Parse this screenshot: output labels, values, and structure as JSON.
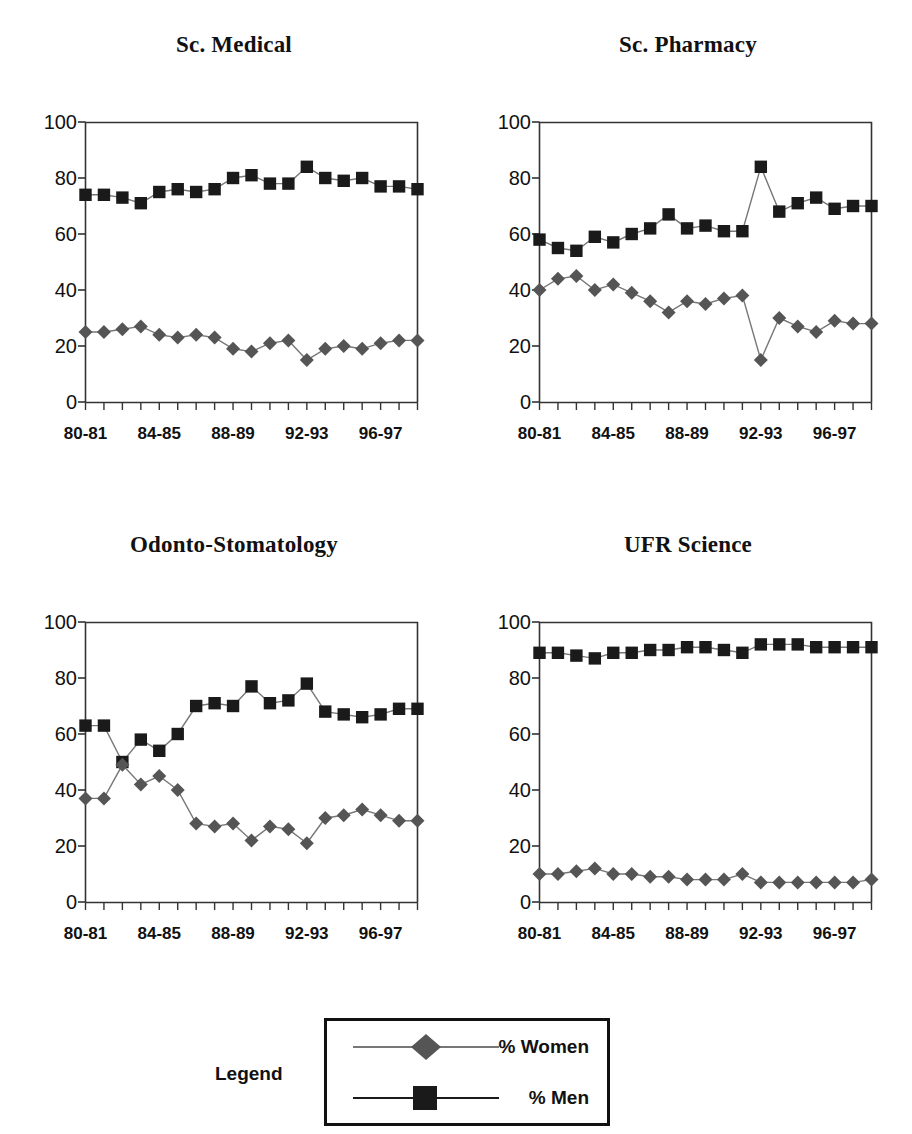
{
  "figure": {
    "legend_label": "Legend",
    "series_names": {
      "women": "% Women",
      "men": "% Men"
    },
    "colors": {
      "women_marker": "#555555",
      "men_marker": "#1a1a1a",
      "line": "#777777",
      "axis": "#333333"
    }
  },
  "chart_data": [
    {
      "type": "line",
      "title": "Sc. Medical",
      "xlabel": "",
      "ylabel": "",
      "ylim": [
        0,
        100
      ],
      "yticks": [
        0,
        20,
        40,
        60,
        80,
        100
      ],
      "grid": false,
      "legend_position": "bottom-shared",
      "categories": [
        "80-81",
        "81-82",
        "82-83",
        "83-84",
        "84-85",
        "85-86",
        "86-87",
        "87-88",
        "88-89",
        "89-90",
        "90-91",
        "91-92",
        "92-93",
        "93-94",
        "94-95",
        "95-96",
        "96-97",
        "97-98",
        "98-99"
      ],
      "tick_labels": [
        "80-81",
        "",
        "",
        "",
        "84-85",
        "",
        "",
        "",
        "88-89",
        "",
        "",
        "",
        "92-93",
        "",
        "",
        "",
        "96-97",
        "",
        ""
      ],
      "series": [
        {
          "name": "% Men",
          "marker": "square",
          "values": [
            74,
            74,
            73,
            71,
            75,
            76,
            75,
            76,
            80,
            81,
            78,
            78,
            84,
            80,
            79,
            80,
            77,
            77,
            76
          ]
        },
        {
          "name": "% Women",
          "marker": "diamond",
          "values": [
            25,
            25,
            26,
            27,
            24,
            23,
            24,
            23,
            19,
            18,
            21,
            22,
            15,
            19,
            20,
            19,
            21,
            22,
            22
          ]
        }
      ]
    },
    {
      "type": "line",
      "title": "Sc. Pharmacy",
      "xlabel": "",
      "ylabel": "",
      "ylim": [
        0,
        100
      ],
      "yticks": [
        0,
        20,
        40,
        60,
        80,
        100
      ],
      "grid": false,
      "legend_position": "bottom-shared",
      "categories": [
        "80-81",
        "81-82",
        "82-83",
        "83-84",
        "84-85",
        "85-86",
        "86-87",
        "87-88",
        "88-89",
        "89-90",
        "90-91",
        "91-92",
        "92-93",
        "93-94",
        "94-95",
        "95-96",
        "96-97",
        "97-98",
        "98-99"
      ],
      "tick_labels": [
        "80-81",
        "",
        "",
        "",
        "84-85",
        "",
        "",
        "",
        "88-89",
        "",
        "",
        "",
        "92-93",
        "",
        "",
        "",
        "96-97",
        "",
        ""
      ],
      "series": [
        {
          "name": "% Men",
          "marker": "square",
          "values": [
            58,
            55,
            54,
            59,
            57,
            60,
            62,
            67,
            62,
            63,
            61,
            61,
            84,
            68,
            71,
            73,
            69,
            70,
            70
          ]
        },
        {
          "name": "% Women",
          "marker": "diamond",
          "values": [
            40,
            44,
            45,
            40,
            42,
            39,
            36,
            32,
            36,
            35,
            37,
            38,
            15,
            30,
            27,
            25,
            29,
            28,
            28
          ]
        }
      ]
    },
    {
      "type": "line",
      "title": "Odonto-Stomatology",
      "xlabel": "",
      "ylabel": "",
      "ylim": [
        0,
        100
      ],
      "yticks": [
        0,
        20,
        40,
        60,
        80,
        100
      ],
      "grid": false,
      "legend_position": "bottom-shared",
      "categories": [
        "80-81",
        "81-82",
        "82-83",
        "83-84",
        "84-85",
        "85-86",
        "86-87",
        "87-88",
        "88-89",
        "89-90",
        "90-91",
        "91-92",
        "92-93",
        "93-94",
        "94-95",
        "95-96",
        "96-97",
        "97-98",
        "98-99"
      ],
      "tick_labels": [
        "80-81",
        "",
        "",
        "",
        "84-85",
        "",
        "",
        "",
        "88-89",
        "",
        "",
        "",
        "92-93",
        "",
        "",
        "",
        "96-97",
        "",
        ""
      ],
      "series": [
        {
          "name": "% Men",
          "marker": "square",
          "values": [
            63,
            63,
            50,
            58,
            54,
            60,
            70,
            71,
            70,
            77,
            71,
            72,
            78,
            68,
            67,
            66,
            67,
            69,
            69
          ]
        },
        {
          "name": "% Women",
          "marker": "diamond",
          "values": [
            37,
            37,
            49,
            42,
            45,
            40,
            28,
            27,
            28,
            22,
            27,
            26,
            21,
            30,
            31,
            33,
            31,
            29,
            29
          ]
        }
      ]
    },
    {
      "type": "line",
      "title": "UFR Science",
      "xlabel": "",
      "ylabel": "",
      "ylim": [
        0,
        100
      ],
      "yticks": [
        0,
        20,
        40,
        60,
        80,
        100
      ],
      "grid": false,
      "legend_position": "bottom-shared",
      "categories": [
        "80-81",
        "81-82",
        "82-83",
        "83-84",
        "84-85",
        "85-86",
        "86-87",
        "87-88",
        "88-89",
        "89-90",
        "90-91",
        "91-92",
        "92-93",
        "93-94",
        "94-95",
        "95-96",
        "96-97",
        "97-98",
        "98-99"
      ],
      "tick_labels": [
        "80-81",
        "",
        "",
        "",
        "84-85",
        "",
        "",
        "",
        "88-89",
        "",
        "",
        "",
        "92-93",
        "",
        "",
        "",
        "96-97",
        "",
        ""
      ],
      "series": [
        {
          "name": "% Men",
          "marker": "square",
          "values": [
            89,
            89,
            88,
            87,
            89,
            89,
            90,
            90,
            91,
            91,
            90,
            89,
            92,
            92,
            92,
            91,
            91,
            91,
            91
          ]
        },
        {
          "name": "% Women",
          "marker": "diamond",
          "values": [
            10,
            10,
            11,
            12,
            10,
            10,
            9,
            9,
            8,
            8,
            8,
            10,
            7,
            7,
            7,
            7,
            7,
            7,
            8
          ]
        }
      ]
    }
  ]
}
